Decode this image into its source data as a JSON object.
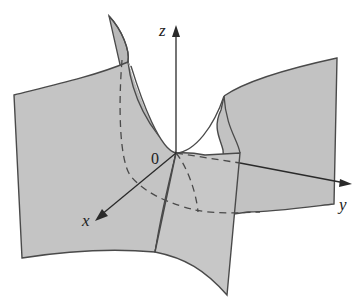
{
  "figure": {
    "type": "3D surface sketch (hyperbolic paraboloid / saddle)",
    "colors": {
      "surface_fill": "#c4c4c4",
      "surface_fill_back": "#b8b8b8",
      "edge": "#4a4a4a",
      "axis": "#2a2a2a",
      "background": "#ffffff"
    },
    "axes": {
      "x": {
        "label": "x"
      },
      "y": {
        "label": "y"
      },
      "z": {
        "label": "z"
      }
    },
    "origin": {
      "label": "0"
    }
  }
}
